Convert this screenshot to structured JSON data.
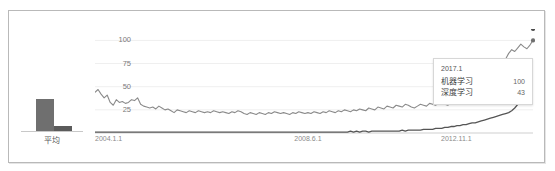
{
  "panel": {
    "name": "trends-chart-panel"
  },
  "average_panel": {
    "label": "平均",
    "bars": [
      {
        "series": "机器学习",
        "value": 32
      },
      {
        "series": "深度学习",
        "value": 5
      }
    ]
  },
  "tooltip": {
    "date": "2017.1",
    "rows": [
      {
        "label": "机器学习",
        "value": "100"
      },
      {
        "label": "深度学习",
        "value": "43"
      }
    ]
  },
  "chart_data": {
    "type": "line",
    "title": "",
    "xlabel": "",
    "ylabel": "",
    "ylim": [
      0,
      108
    ],
    "yticks": [
      "100",
      "75",
      "50",
      "25"
    ],
    "ytick_values": [
      100,
      75,
      50,
      25
    ],
    "xticks": [
      "2004.1.1",
      "2008.6.1",
      "2012.11.1"
    ],
    "xtick_positions": [
      0,
      0.455,
      0.79
    ],
    "grid": true,
    "legend": "none",
    "colors": {
      "machine_learning": "#8a8a8a",
      "deep_learning": "#555555"
    },
    "series": [
      {
        "name": "机器学习",
        "color": "#8a8a8a",
        "values": [
          44,
          47,
          42,
          38,
          41,
          33,
          30,
          36,
          33,
          34,
          32,
          33,
          36,
          35,
          38,
          31,
          29,
          28,
          27,
          28,
          26,
          29,
          27,
          25,
          26,
          24,
          22,
          25,
          24,
          23,
          22,
          24,
          23,
          22,
          24,
          23,
          22,
          23,
          22,
          24,
          23,
          22,
          23,
          22,
          21,
          23,
          22,
          24,
          23,
          21,
          20,
          22,
          21,
          20,
          22,
          21,
          20,
          22,
          21,
          23,
          22,
          21,
          22,
          21,
          20,
          22,
          21,
          23,
          22,
          21,
          22,
          21,
          23,
          22,
          21,
          23,
          22,
          24,
          23,
          22,
          24,
          23,
          25,
          24,
          23,
          25,
          24,
          26,
          25,
          24,
          27,
          26,
          25,
          28,
          27,
          26,
          29,
          28,
          27,
          30,
          29,
          28,
          31,
          30,
          28,
          27,
          29,
          31,
          30,
          29,
          32,
          31,
          30,
          33,
          32,
          31,
          30,
          33,
          35,
          34,
          33,
          36,
          34,
          38,
          37,
          36,
          40,
          42,
          45,
          48,
          52,
          56,
          62,
          68,
          74,
          80,
          86,
          90,
          88,
          92,
          96,
          93,
          91,
          95,
          100
        ]
      },
      {
        "name": "深度学习",
        "color": "#555555",
        "values": [
          1,
          1,
          1,
          1,
          1,
          1,
          1,
          1,
          1,
          1,
          1,
          1,
          1,
          1,
          1,
          1,
          1,
          1,
          1,
          1,
          1,
          1,
          1,
          1,
          1,
          1,
          1,
          1,
          1,
          1,
          1,
          1,
          1,
          1,
          1,
          1,
          1,
          1,
          1,
          1,
          1,
          1,
          1,
          1,
          1,
          1,
          1,
          1,
          1,
          1,
          1,
          1,
          1,
          1,
          1,
          1,
          1,
          1,
          1,
          1,
          1,
          1,
          1,
          1,
          1,
          1,
          1,
          1,
          1,
          1,
          1,
          1,
          1,
          1,
          1,
          1,
          1,
          1,
          1,
          1,
          1,
          1,
          1,
          1,
          2,
          1,
          2,
          1,
          2,
          2,
          1,
          2,
          2,
          2,
          2,
          2,
          2,
          2,
          2,
          2,
          2,
          3,
          2,
          3,
          3,
          3,
          3,
          3,
          4,
          4,
          4,
          4,
          5,
          5,
          5,
          6,
          6,
          7,
          7,
          8,
          8,
          9,
          9,
          10,
          11,
          11,
          12,
          13,
          14,
          15,
          16,
          17,
          18,
          19,
          20,
          21,
          22,
          24,
          27,
          31,
          34,
          38,
          41,
          43
        ]
      }
    ]
  }
}
